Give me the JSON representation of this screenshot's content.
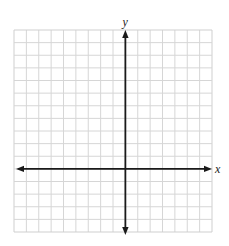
{
  "diagram": {
    "type": "coordinate-plane",
    "grid": {
      "columns": 16,
      "rows": 16,
      "left": 14,
      "top": 30,
      "right": 212,
      "bottom": 232,
      "line_color": "#d6d6d6",
      "border_color": "#cfcfcf"
    },
    "axes": {
      "color": "#1a1a1a",
      "x_axis_row": 11,
      "y_axis_col": 9,
      "x_label": "x",
      "y_label": "y",
      "x_arrow_left": 16,
      "x_arrow_right": 212,
      "y_arrow_top": 30,
      "y_arrow_bottom": 235
    }
  }
}
